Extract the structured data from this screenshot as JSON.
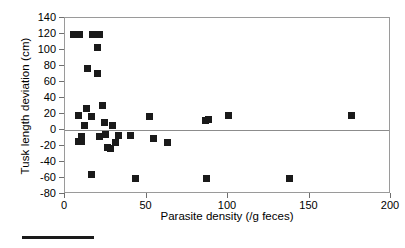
{
  "chart_data": {
    "type": "scatter",
    "title": "",
    "xlabel": "Parasite density (/g feces)",
    "ylabel": "Tusk length deviation (cm)",
    "xlim": [
      0,
      200
    ],
    "ylim": [
      -80,
      140
    ],
    "xticks": [
      0,
      50,
      100,
      150,
      200
    ],
    "yticks": [
      -80,
      -60,
      -40,
      -20,
      0,
      20,
      40,
      60,
      80,
      100,
      120,
      140
    ],
    "grid": false,
    "legend": null,
    "zero_reference_line": 0,
    "marker": "filled-square",
    "marker_color": "#1a1a1a",
    "frame_color": "#9a9a9a",
    "points": [
      {
        "x": 5,
        "y": 120
      },
      {
        "x": 7,
        "y": 120
      },
      {
        "x": 9,
        "y": 120
      },
      {
        "x": 17,
        "y": 120
      },
      {
        "x": 19,
        "y": 120
      },
      {
        "x": 21,
        "y": 120
      },
      {
        "x": 20,
        "y": 103
      },
      {
        "x": 14,
        "y": 77
      },
      {
        "x": 20,
        "y": 71
      },
      {
        "x": 23,
        "y": 31
      },
      {
        "x": 13,
        "y": 27
      },
      {
        "x": 8,
        "y": 18
      },
      {
        "x": 16,
        "y": 17
      },
      {
        "x": 24,
        "y": 10
      },
      {
        "x": 12,
        "y": 6
      },
      {
        "x": 29,
        "y": 6
      },
      {
        "x": 52,
        "y": 17
      },
      {
        "x": 86,
        "y": 12
      },
      {
        "x": 88,
        "y": 13
      },
      {
        "x": 100,
        "y": 18
      },
      {
        "x": 176,
        "y": 18
      },
      {
        "x": 10,
        "y": -8
      },
      {
        "x": 21,
        "y": -8
      },
      {
        "x": 25,
        "y": -6
      },
      {
        "x": 33,
        "y": -7
      },
      {
        "x": 40,
        "y": -7
      },
      {
        "x": 8,
        "y": -14
      },
      {
        "x": 10,
        "y": -14
      },
      {
        "x": 31,
        "y": -16
      },
      {
        "x": 26,
        "y": -22
      },
      {
        "x": 28,
        "y": -23
      },
      {
        "x": 54,
        "y": -10
      },
      {
        "x": 63,
        "y": -16
      },
      {
        "x": 16,
        "y": -56
      },
      {
        "x": 43,
        "y": -61
      },
      {
        "x": 87,
        "y": -60
      },
      {
        "x": 138,
        "y": -60
      }
    ]
  }
}
